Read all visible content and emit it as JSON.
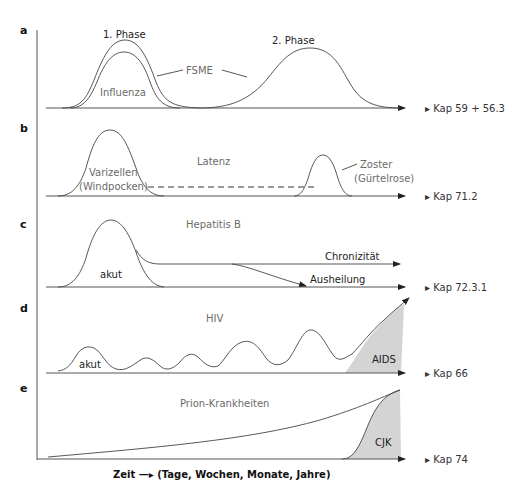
{
  "figure": {
    "x_axis_label": "Zeit —▸ (Tage, Wochen, Monate, Jahre)",
    "kap_marker_glyph": "▸"
  },
  "panels": [
    {
      "letter": "a",
      "labels": {
        "phase1": "1. Phase",
        "phase2": "2. Phase",
        "fsme": "FSME",
        "influenza": "Influenza"
      },
      "kap": "Kap 59 + 56.3"
    },
    {
      "letter": "b",
      "labels": {
        "varizellen": "Varizellen",
        "windpocken": "(Windpocken)",
        "latenz": "Latenz",
        "zoster": "Zoster",
        "guertelrose": "(Gürtelrose)"
      },
      "kap": "Kap 71.2"
    },
    {
      "letter": "c",
      "labels": {
        "title": "Hepatitis B",
        "akut": "akut",
        "chronizitaet": "Chronizität",
        "ausheilung": "Ausheilung"
      },
      "kap": "Kap 72.3.1"
    },
    {
      "letter": "d",
      "labels": {
        "title": "HIV",
        "akut": "akut",
        "aids": "AIDS"
      },
      "kap": "Kap 66"
    },
    {
      "letter": "e",
      "labels": {
        "title": "Prion-Krankheiten",
        "cjk": "CJK"
      },
      "kap": "Kap 74"
    }
  ],
  "colors": {
    "line": "#444444",
    "shade": "#d4d4d4",
    "label_grey": "#6b6b6b"
  }
}
